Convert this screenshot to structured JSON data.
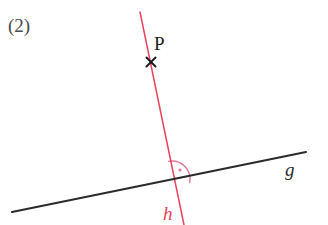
{
  "figure": {
    "width": 328,
    "height": 225,
    "background_color": "#ffffff",
    "item_number": "(2)"
  },
  "labels": {
    "item_number": "(2)",
    "point_p": "P",
    "line_g": "g",
    "line_h": "h"
  },
  "colors": {
    "line_g": "#2b2b2b",
    "line_h": "#e8435a",
    "angle_marker": "#e07a95",
    "point_mark": "#1d1d1d",
    "label_dark": "#4a4a4a",
    "background": "#ffffff"
  },
  "geometry": {
    "line_g": {
      "name": "g",
      "color": "#2b2b2b",
      "stroke_width": 2.1,
      "x1": 12,
      "y1": 212,
      "x2": 306,
      "y2": 152
    },
    "line_h": {
      "name": "h",
      "color": "#e8435a",
      "stroke_width": 1.5,
      "x1": 140,
      "y1": 12,
      "x2": 184,
      "y2": 225
    },
    "point_p": {
      "name": "P",
      "marker": "x-cross",
      "cx": 151,
      "cy": 62,
      "size": 9,
      "color": "#1d1d1d",
      "stroke_width": 2
    },
    "intersection": {
      "cx": 172,
      "cy": 179
    },
    "angle_marker": {
      "type": "right-angle-arc",
      "cx": 172,
      "cy": 179,
      "radius": 18,
      "start_angle_deg": 101,
      "end_angle_deg": -11,
      "color": "#e07a95",
      "stroke_width": 1.4,
      "dot": {
        "cx": 180,
        "cy": 170,
        "r": 1.6
      }
    }
  }
}
